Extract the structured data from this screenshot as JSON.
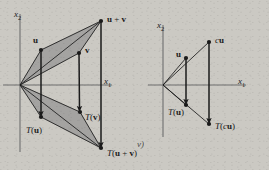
{
  "figure": {
    "caption": "Linear transformation preserves vector addition and scalar multiplication",
    "background_color": "#cbc9c3",
    "shade_color": "#8c8c8c",
    "ink_color": "#1a1a1a",
    "axis_color": "#6e6e6e"
  },
  "panels": [
    {
      "id": "addition-panel",
      "name": "vector-addition",
      "origin": {
        "x": 20,
        "y": 85
      },
      "axes": {
        "x_label": "x1",
        "x_label_text": "x",
        "x_label_sub": "1",
        "y_label_text": "x",
        "y_label_sub": "2",
        "x_axis": {
          "x1": 3,
          "y1": 85,
          "x2": 112,
          "y2": 85
        },
        "y_axis": {
          "x1": 20,
          "y1": 14,
          "x2": 20,
          "y2": 152
        },
        "x_label_pos": {
          "x": 104,
          "y": 77
        },
        "y_label_pos": {
          "x": 14,
          "y": 10
        }
      },
      "points": [
        {
          "name": "u",
          "label": "u",
          "label_html": "<b>u</b>",
          "x": 41,
          "y": 50,
          "label_x": 33,
          "label_y": 36
        },
        {
          "name": "v",
          "label": "v",
          "label_html": "<b>v</b>",
          "x": 79,
          "y": 53,
          "label_x": 85,
          "label_y": 46
        },
        {
          "name": "u+v",
          "label": "u + v",
          "label_html": "<b>u</b> + <b>v</b>",
          "x": 101,
          "y": 21,
          "label_x": 107,
          "label_y": 15
        },
        {
          "name": "T(u)",
          "label": "T(u)",
          "label_html": "<i>T</i>(<b>u</b>)",
          "x": 41,
          "y": 117,
          "label_x": 26,
          "label_y": 126
        },
        {
          "name": "T(v)",
          "label": "T(v)",
          "label_html": "<i>T</i>(<b>v</b>)",
          "x": 80,
          "y": 112,
          "label_x": 85,
          "label_y": 113
        },
        {
          "name": "T(u+v)",
          "label": "T(u + v)",
          "label_html": "<i>T</i>(<b>u</b> + <b>v</b>)",
          "x": 101,
          "y": 148,
          "label_x": 107,
          "label_y": 149
        }
      ],
      "shaded_regions": [
        {
          "name": "upper-triangle",
          "points": "20,85 41,50 101,21 79,53"
        },
        {
          "name": "lower-triangle",
          "points": "20,85 41,117 101,148 80,112"
        }
      ],
      "ray_lines": [
        {
          "name": "ray-origin-to-u",
          "x1": 20,
          "y1": 85,
          "x2": 41,
          "y2": 50
        },
        {
          "name": "ray-origin-to-v",
          "x1": 20,
          "y1": 85,
          "x2": 79,
          "y2": 53
        },
        {
          "name": "ray-origin-to-uv",
          "x1": 20,
          "y1": 85,
          "x2": 101,
          "y2": 21
        },
        {
          "name": "ray-u-to-uv",
          "x1": 41,
          "y1": 50,
          "x2": 101,
          "y2": 21
        },
        {
          "name": "ray-v-to-uv",
          "x1": 79,
          "y1": 53,
          "x2": 101,
          "y2": 21
        },
        {
          "name": "ray-origin-to-Tu",
          "x1": 20,
          "y1": 85,
          "x2": 41,
          "y2": 117
        },
        {
          "name": "ray-origin-to-Tv",
          "x1": 20,
          "y1": 85,
          "x2": 80,
          "y2": 112
        },
        {
          "name": "ray-origin-to-Tuv",
          "x1": 20,
          "y1": 85,
          "x2": 101,
          "y2": 148
        },
        {
          "name": "ray-Tu-to-Tuv",
          "x1": 41,
          "y1": 117,
          "x2": 101,
          "y2": 148
        },
        {
          "name": "ray-Tv-to-Tuv",
          "x1": 80,
          "y1": 112,
          "x2": 101,
          "y2": 148
        }
      ],
      "map_arrows": [
        {
          "name": "arrow-u-to-Tu",
          "x1": 41,
          "y1": 50,
          "x2": 41,
          "y2": 114
        },
        {
          "name": "arrow-v-to-Tv",
          "x1": 79,
          "y1": 53,
          "x2": 79.5,
          "y2": 109
        },
        {
          "name": "arrow-uv-to-Tuv",
          "x1": 101,
          "y1": 21,
          "x2": 101,
          "y2": 145
        }
      ]
    },
    {
      "id": "scalar-panel",
      "name": "scalar-multiplication",
      "origin": {
        "x": 163,
        "y": 85
      },
      "axes": {
        "x_label_text": "x",
        "x_label_sub": "1",
        "y_label_text": "x",
        "y_label_sub": "2",
        "x_axis": {
          "x1": 148,
          "y1": 85,
          "x2": 246,
          "y2": 85
        },
        "y_axis": {
          "x1": 163,
          "y1": 25,
          "x2": 163,
          "y2": 137
        },
        "x_label_pos": {
          "x": 238,
          "y": 77
        },
        "y_label_pos": {
          "x": 157,
          "y": 21
        }
      },
      "points": [
        {
          "name": "u",
          "label": "u",
          "label_html": "<b>u</b>",
          "x": 186,
          "y": 58,
          "label_x": 176,
          "label_y": 50
        },
        {
          "name": "cu",
          "label": "cu",
          "label_html": "<i>c</i><b>u</b>",
          "x": 209,
          "y": 42,
          "label_x": 215,
          "label_y": 36
        },
        {
          "name": "T(u)",
          "label": "T(u)",
          "label_html": "<i>T</i>(<b>u</b>)",
          "x": 186,
          "y": 105,
          "label_x": 168,
          "label_y": 108
        },
        {
          "name": "T(cu)",
          "label": "T(cu)",
          "label_html": "<i>T</i>(<i>c</i><b>u</b>)",
          "x": 209,
          "y": 124,
          "label_x": 215,
          "label_y": 122
        }
      ],
      "shaded_regions": [],
      "ray_lines": [
        {
          "name": "ray-origin-to-u",
          "x1": 163,
          "y1": 85,
          "x2": 186,
          "y2": 58
        },
        {
          "name": "ray-origin-to-cu",
          "x1": 163,
          "y1": 85,
          "x2": 209,
          "y2": 42
        },
        {
          "name": "ray-origin-to-Tu",
          "x1": 163,
          "y1": 85,
          "x2": 186,
          "y2": 105
        },
        {
          "name": "ray-origin-to-Tcu",
          "x1": 163,
          "y1": 85,
          "x2": 209,
          "y2": 124
        }
      ],
      "map_arrows": [
        {
          "name": "arrow-u-to-Tu",
          "x1": 186,
          "y1": 58,
          "x2": 186,
          "y2": 102
        },
        {
          "name": "arrow-cu-to-Tcu",
          "x1": 209,
          "y1": 42,
          "x2": 209,
          "y2": 121
        }
      ]
    }
  ],
  "stray_text": {
    "name": "bleed-through-text",
    "text": "v)",
    "x": 137,
    "y": 140
  }
}
